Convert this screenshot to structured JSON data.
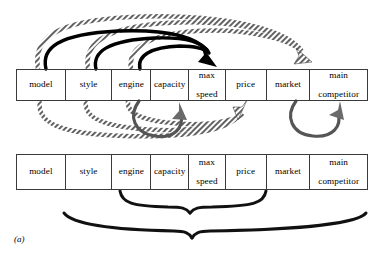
{
  "figure": {
    "caption": "(a)",
    "colors": {
      "table_border": "#3a3a3a",
      "solid_arrow": "#000000",
      "gray_arrow": "#555555",
      "hatched_arrow": "#555555",
      "brace": "#111111",
      "background": "#ffffff"
    }
  },
  "tables": [
    {
      "id": "top-table",
      "name": "attribute-row-top",
      "columns": [
        {
          "label": "model",
          "width": 49
        },
        {
          "label": "style",
          "width": 47
        },
        {
          "label": "engine",
          "width": 39
        },
        {
          "label": "capacity",
          "width": 38
        },
        {
          "label": "max\nspeed",
          "line1": "max",
          "line2": "speed",
          "width": 37
        },
        {
          "label": "price",
          "width": 41
        },
        {
          "label": "market",
          "width": 44
        },
        {
          "label": "main\ncompetitor",
          "line1": "main",
          "line2": "competitor",
          "width": 57
        }
      ]
    },
    {
      "id": "bottom-table",
      "name": "attribute-row-bottom",
      "columns": [
        {
          "label": "model",
          "width": 49
        },
        {
          "label": "style",
          "width": 47
        },
        {
          "label": "engine",
          "width": 39
        },
        {
          "label": "capacity",
          "width": 38
        },
        {
          "label": "max\nspeed",
          "line1": "max",
          "line2": "speed",
          "width": 37
        },
        {
          "label": "price",
          "width": 41
        },
        {
          "label": "market",
          "width": 44
        },
        {
          "label": "main\ncompetitor",
          "line1": "main",
          "line2": "competitor",
          "width": 57
        }
      ]
    }
  ],
  "dependencies": {
    "above_table": [
      {
        "from": "model",
        "to": "max speed",
        "style": "solid-black"
      },
      {
        "from": "style",
        "to": "max speed",
        "style": "solid-black"
      },
      {
        "from": "engine",
        "to": "max speed",
        "style": "solid-black"
      },
      {
        "from": "model",
        "to": "market",
        "style": "hatched"
      },
      {
        "from": "style",
        "to": "market",
        "style": "hatched"
      },
      {
        "from": "engine",
        "to": "market",
        "style": "hatched"
      }
    ],
    "below_table": [
      {
        "from": "engine",
        "to": "capacity",
        "style": "solid-gray"
      },
      {
        "from": "market",
        "to": "main competitor",
        "style": "solid-gray"
      },
      {
        "from": "model",
        "to": "price",
        "style": "hatched"
      },
      {
        "from": "style",
        "to": "price",
        "style": "hatched"
      },
      {
        "from": "engine",
        "to": "price",
        "style": "hatched"
      }
    ]
  },
  "braces": [
    {
      "name": "inner-brace",
      "spans": [
        "engine",
        "capacity",
        "max speed",
        "price"
      ]
    },
    {
      "name": "outer-brace",
      "spans": [
        "style",
        "engine",
        "capacity",
        "max speed",
        "price",
        "market",
        "main competitor"
      ]
    }
  ]
}
